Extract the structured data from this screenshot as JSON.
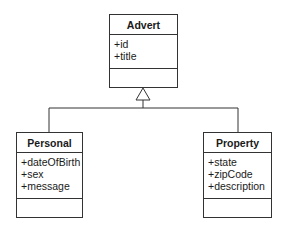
{
  "diagram": {
    "type": "uml-class-diagram",
    "relationship": "generalization",
    "parent": {
      "name": "Advert",
      "attributes": [
        "+id",
        "+title"
      ],
      "operations": []
    },
    "children": [
      {
        "name": "Personal",
        "attributes": [
          "+dateOfBirth",
          "+sex",
          "+message"
        ],
        "operations": []
      },
      {
        "name": "Property",
        "attributes": [
          "+state",
          "+zipCode",
          "+description"
        ],
        "operations": []
      }
    ]
  }
}
